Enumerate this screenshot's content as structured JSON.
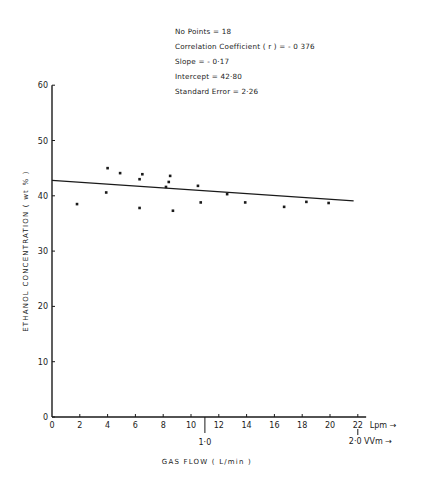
{
  "chart_data": {
    "type": "scatter",
    "title": "",
    "xlabel": "GAS FLOW ( L/min )",
    "ylabel": "ETHANOL CONCENTRATION ( wt % )",
    "xlim": [
      0,
      22
    ],
    "ylim": [
      0,
      60
    ],
    "x_ticks": [
      0,
      2,
      4,
      6,
      8,
      10,
      12,
      14,
      16,
      18,
      20,
      22
    ],
    "y_ticks": [
      0,
      10,
      20,
      30,
      40,
      50,
      60
    ],
    "x_unit_primary": "Lpm",
    "secondary_axis": {
      "ticks": [
        {
          "x": 11,
          "label": "1·0"
        },
        {
          "x": 22,
          "label": "2·0"
        }
      ],
      "unit": "VVm"
    },
    "grid": false,
    "series": [
      {
        "name": "data",
        "points": [
          [
            1.8,
            38.5
          ],
          [
            4.0,
            45.0
          ],
          [
            3.9,
            40.6
          ],
          [
            4.9,
            44.1
          ],
          [
            6.3,
            43.0
          ],
          [
            6.5,
            43.9
          ],
          [
            6.3,
            37.8
          ],
          [
            8.5,
            43.6
          ],
          [
            8.4,
            42.5
          ],
          [
            8.2,
            41.6
          ],
          [
            8.7,
            37.3
          ],
          [
            10.5,
            41.8
          ],
          [
            10.7,
            38.8
          ],
          [
            12.6,
            40.3
          ],
          [
            13.9,
            38.8
          ],
          [
            16.7,
            38.0
          ],
          [
            18.3,
            38.9
          ],
          [
            19.9,
            38.7
          ]
        ]
      },
      {
        "name": "regression line",
        "type": "line",
        "points": [
          [
            0,
            42.8
          ],
          [
            21.7,
            39.1
          ]
        ]
      }
    ],
    "annotations": [
      "No Points = 18",
      "Correlation Coefficient (r) = - 0.376",
      "Slope = - 0.17",
      "Intercept = 42.80",
      "Standard Error = 2.26"
    ]
  },
  "stats": {
    "points": "No Points = 18",
    "correlation": "Correlation Coefficient ( r ) = - 0 376",
    "slope": "Slope = - 0·17",
    "intercept": "Intercept = 42·80",
    "std_error": "Standard Error = 2·26"
  },
  "axes": {
    "ylabel": "ETHANOL CONCENTRATION ( wt % )",
    "xlabel": "GAS FLOW ( L/min )",
    "lpm_label": "Lpm →",
    "vvm_label": "2·0 VVm →",
    "vvm_mid": "1·0"
  }
}
